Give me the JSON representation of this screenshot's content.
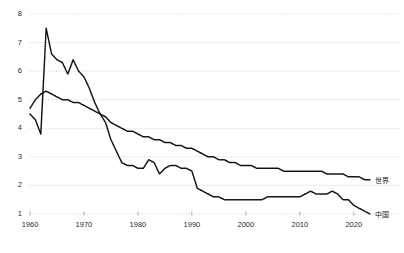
{
  "chart_data": {
    "type": "line",
    "title": "",
    "subtitle": "",
    "xlabel": "",
    "ylabel": "",
    "xlim": [
      1960,
      2023
    ],
    "ylim": [
      0.8,
      8.2
    ],
    "grid": true,
    "grid_axis": "y",
    "legend_position": "right-inline",
    "xticks": [
      1960,
      1970,
      1980,
      1990,
      2000,
      2010,
      2020
    ],
    "xtick_labels": [
      "1960",
      "1970",
      "1980",
      "1990",
      "2000",
      "2010",
      "2020"
    ],
    "yticks": [
      1,
      2,
      3,
      4,
      5,
      6,
      7,
      8
    ],
    "ytick_labels": [
      "1",
      "2",
      "3",
      "4",
      "5",
      "6",
      "7",
      "8"
    ],
    "x": [
      1960,
      1961,
      1962,
      1963,
      1964,
      1965,
      1966,
      1967,
      1968,
      1969,
      1970,
      1971,
      1972,
      1973,
      1974,
      1975,
      1976,
      1977,
      1978,
      1979,
      1980,
      1981,
      1982,
      1983,
      1984,
      1985,
      1986,
      1987,
      1988,
      1989,
      1990,
      1991,
      1992,
      1993,
      1994,
      1995,
      1996,
      1997,
      1998,
      1999,
      2000,
      2001,
      2002,
      2003,
      2004,
      2005,
      2006,
      2007,
      2008,
      2009,
      2010,
      2011,
      2012,
      2013,
      2014,
      2015,
      2016,
      2017,
      2018,
      2019,
      2020,
      2021,
      2022,
      2023
    ],
    "series": [
      {
        "name": "中国",
        "label": "中国",
        "color": "#111111",
        "style": "dotted-line",
        "values": [
          4.5,
          4.3,
          3.8,
          7.5,
          6.6,
          6.4,
          6.3,
          5.9,
          6.4,
          6.0,
          5.8,
          5.4,
          4.9,
          4.5,
          4.2,
          3.6,
          3.2,
          2.8,
          2.7,
          2.7,
          2.6,
          2.6,
          2.9,
          2.8,
          2.4,
          2.6,
          2.7,
          2.7,
          2.6,
          2.6,
          2.5,
          1.9,
          1.8,
          1.7,
          1.6,
          1.6,
          1.5,
          1.5,
          1.5,
          1.5,
          1.5,
          1.5,
          1.5,
          1.5,
          1.6,
          1.6,
          1.6,
          1.6,
          1.6,
          1.6,
          1.6,
          1.7,
          1.8,
          1.7,
          1.7,
          1.7,
          1.8,
          1.7,
          1.5,
          1.5,
          1.3,
          1.2,
          1.1,
          1.0
        ]
      },
      {
        "name": "世界",
        "label": "世界",
        "color": "#111111",
        "style": "dotted-line",
        "values": [
          4.7,
          5.0,
          5.2,
          5.3,
          5.2,
          5.1,
          5.0,
          5.0,
          4.9,
          4.9,
          4.8,
          4.7,
          4.6,
          4.5,
          4.4,
          4.2,
          4.1,
          4.0,
          3.9,
          3.9,
          3.8,
          3.7,
          3.7,
          3.6,
          3.6,
          3.5,
          3.5,
          3.4,
          3.4,
          3.3,
          3.3,
          3.2,
          3.1,
          3.0,
          3.0,
          2.9,
          2.9,
          2.8,
          2.8,
          2.7,
          2.7,
          2.7,
          2.6,
          2.6,
          2.6,
          2.6,
          2.6,
          2.5,
          2.5,
          2.5,
          2.5,
          2.5,
          2.5,
          2.5,
          2.5,
          2.4,
          2.4,
          2.4,
          2.4,
          2.3,
          2.3,
          2.3,
          2.2,
          2.2
        ]
      }
    ],
    "legend": [
      {
        "label": "世界",
        "value_at_end": 2.2
      },
      {
        "label": "中国",
        "value_at_end": 1.0
      }
    ]
  }
}
